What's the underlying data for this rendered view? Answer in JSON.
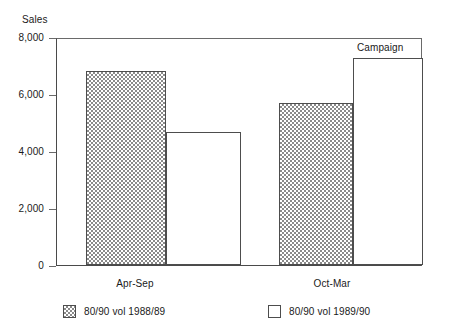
{
  "chart_data": {
    "type": "bar",
    "title": "",
    "ylabel": "Sales",
    "xlabel": "",
    "ylim": [
      0,
      8000
    ],
    "yticks": [
      "0",
      "2,000",
      "4,000",
      "6,000",
      "8,000"
    ],
    "ytick_values": [
      0,
      2000,
      4000,
      6000,
      8000
    ],
    "grid": false,
    "legend_position": "bottom",
    "categories": [
      "Apr-Sep",
      "Oct-Mar"
    ],
    "series": [
      {
        "name": "80/90 vol 1988/89",
        "style": "hatched",
        "values": [
          6880,
          5750
        ]
      },
      {
        "name": "80/90 vol 1989/90",
        "style": "open",
        "values": [
          4700,
          7330
        ]
      }
    ],
    "annotations": [
      {
        "text": "Campaign",
        "target_series": "80/90 vol 1989/90",
        "target_category": "Oct-Mar"
      }
    ]
  },
  "axis": {
    "y_title": "Sales"
  },
  "legend": {
    "entries": [
      {
        "label": "80/90 vol 1988/89",
        "swatch": "hatched-swatch"
      },
      {
        "label": "80/90 vol 1989/90",
        "swatch": "open-swatch"
      }
    ]
  },
  "colors": {
    "axis": "#4a4a4a",
    "frame": "#6a6a6a",
    "bar_outline": "#4d4d4d",
    "hatch": "#8a8a8a",
    "background": "#ffffff",
    "text": "#1a1a1a"
  }
}
